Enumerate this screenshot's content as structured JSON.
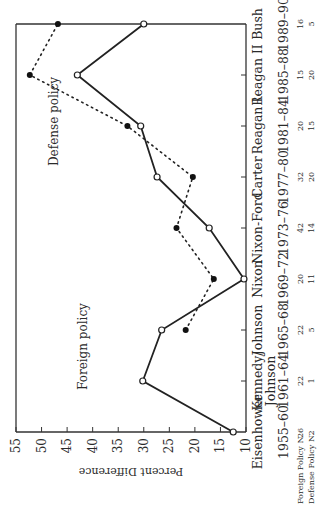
{
  "chart_data": {
    "type": "line",
    "title": "",
    "xlabel": "",
    "ylabel": "Percent Difference",
    "ylim": [
      10,
      55
    ],
    "yticks": [
      10,
      15,
      20,
      25,
      30,
      35,
      40,
      45,
      50,
      55
    ],
    "grid": false,
    "orientation": "rotated 90 degrees counter-clockwise on page",
    "categories": [
      "Eisenhower",
      "Kennedy/ Johnson",
      "Johnson",
      "Nixon",
      "Nixon-Ford",
      "Carter",
      "Reagan I",
      "Reagan II",
      "Bush"
    ],
    "periods": [
      "1955–60",
      "1961–64",
      "1965–68",
      "1969–72",
      "1973–76",
      "1977–80",
      "1981–84",
      "1985–88",
      "1989–90"
    ],
    "series": [
      {
        "name": "Foreign policy",
        "style": "solid line, open circles",
        "values": [
          12.5,
          30.2,
          26.5,
          10.4,
          17.2,
          27.4,
          30.6,
          43.0,
          30.0
        ]
      },
      {
        "name": "Defense policy",
        "style": "dotted line, filled circles",
        "values": [
          null,
          null,
          21.8,
          16.3,
          23.6,
          20.4,
          33.2,
          52.3,
          46.8
        ]
      }
    ],
    "annotations": [
      "Foreign policy",
      "Defense policy"
    ],
    "n_rows": [
      {
        "label": "Foreign Policy N",
        "values": [
          "26",
          "22",
          "22",
          "20",
          "42",
          "32",
          "20",
          "15",
          "16"
        ]
      },
      {
        "label": "Defense Policy N",
        "values": [
          "2",
          "1",
          "5",
          "11",
          "14",
          "20",
          "15",
          "20",
          "5"
        ]
      }
    ]
  }
}
